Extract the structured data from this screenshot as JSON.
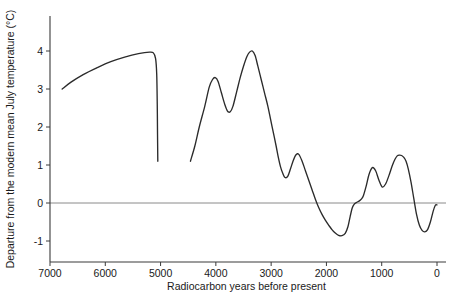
{
  "chart_data": {
    "type": "line",
    "title": "",
    "xlabel": "Radiocarbon years before present",
    "ylabel": "Departure from the modern mean July temperature (°C)",
    "xlim": [
      7000,
      0
    ],
    "ylim": [
      -1.45,
      4.45
    ],
    "x_ticks": [
      7000,
      6000,
      5000,
      4000,
      3000,
      2000,
      1000,
      0
    ],
    "x_tick_labels": [
      "7000",
      "6000",
      "5000",
      "4000",
      "3000",
      "2000",
      "1000",
      "0"
    ],
    "y_ticks": [
      -1,
      0,
      1,
      2,
      3,
      4
    ],
    "y_tick_labels": [
      "-1",
      "0",
      "1",
      "2",
      "3",
      "4"
    ],
    "x_axis_reversed": true,
    "grid": false,
    "legend": null,
    "reference_lines": [
      {
        "name": "zero-departure-line",
        "axis": "y",
        "value": 0,
        "color": "#8a8a8a"
      }
    ],
    "line_color": "#2b2b2b",
    "series": [
      {
        "name": "July temperature departure",
        "note": "Curve is drawn as two separate segments with a data gap between about 5050 and 4450 radiocarbon years BP.",
        "segments": [
          {
            "name": "early-holocene-segment",
            "x": [
              6780,
              6620,
              6400,
              6150,
              5900,
              5650,
              5400,
              5200,
              5130,
              5090,
              5070,
              5060,
              5055,
              5050
            ],
            "y": [
              3.0,
              3.18,
              3.38,
              3.56,
              3.72,
              3.84,
              3.93,
              3.97,
              3.95,
              3.8,
              3.4,
              2.6,
              1.8,
              1.1
            ]
          },
          {
            "name": "late-holocene-segment",
            "x": [
              4460,
              4380,
              4300,
              4200,
              4120,
              4060,
              4010,
              3960,
              3900,
              3840,
              3790,
              3740,
              3690,
              3620,
              3560,
              3500,
              3440,
              3390,
              3340,
              3290,
              3240,
              3180,
              3120,
              3060,
              3010,
              2960,
              2910,
              2870,
              2830,
              2790,
              2750,
              2700,
              2650,
              2600,
              2550,
              2500,
              2440,
              2380,
              2320,
              2260,
              2200,
              2140,
              2080,
              2020,
              1960,
              1900,
              1840,
              1780,
              1720,
              1660,
              1610,
              1570,
              1530,
              1490,
              1450,
              1410,
              1370,
              1330,
              1280,
              1230,
              1170,
              1110,
              1050,
              990,
              930,
              870,
              810,
              760,
              720,
              680,
              640,
              600,
              560,
              520,
              470,
              420,
              370,
              320,
              270,
              220,
              170,
              120,
              70,
              30,
              0
            ],
            "y": [
              1.1,
              1.5,
              2.0,
              2.55,
              3.05,
              3.25,
              3.3,
              3.2,
              2.9,
              2.6,
              2.42,
              2.4,
              2.55,
              2.95,
              3.3,
              3.6,
              3.85,
              3.97,
              4.0,
              3.88,
              3.6,
              3.25,
              2.9,
              2.55,
              2.2,
              1.85,
              1.5,
              1.2,
              0.95,
              0.78,
              0.67,
              0.7,
              0.9,
              1.12,
              1.27,
              1.28,
              1.1,
              0.85,
              0.6,
              0.35,
              0.1,
              -0.12,
              -0.3,
              -0.45,
              -0.58,
              -0.7,
              -0.79,
              -0.85,
              -0.86,
              -0.8,
              -0.62,
              -0.35,
              -0.12,
              -0.02,
              0.02,
              0.05,
              0.1,
              0.2,
              0.45,
              0.75,
              0.93,
              0.85,
              0.6,
              0.42,
              0.5,
              0.72,
              0.98,
              1.15,
              1.24,
              1.26,
              1.25,
              1.2,
              1.1,
              0.9,
              0.55,
              0.12,
              -0.3,
              -0.58,
              -0.72,
              -0.76,
              -0.7,
              -0.5,
              -0.22,
              -0.06,
              -0.05
            ]
          }
        ]
      }
    ]
  }
}
